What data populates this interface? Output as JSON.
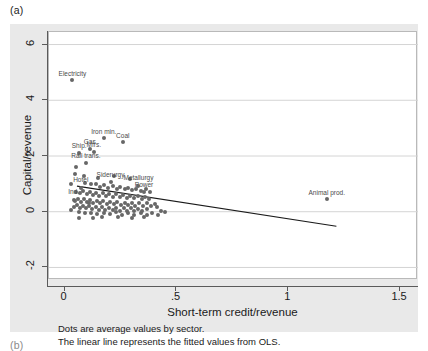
{
  "panel": {
    "letter_a": "(a)",
    "letter_b": "(b)"
  },
  "caption": {
    "line1": "Dots are average values by sector.",
    "line2": "The linear line represents the fitted values from OLS."
  },
  "colors": {
    "figure_background": "#e9e9e9",
    "plot_background": "#ffffff",
    "marker": "#676767",
    "fit_line": "#1a1a1a",
    "grid": "#d4d4d4",
    "axis": "#5a5a5a"
  },
  "chart_data": {
    "type": "scatter",
    "title": "",
    "xlabel": "Short-term credit/revenue",
    "ylabel": "Capital/revenue",
    "xlim": [
      -0.07,
      1.58
    ],
    "ylim": [
      -2.45,
      6.45
    ],
    "xticks": [
      0,
      0.5,
      1,
      1.5
    ],
    "xticklabels": [
      "0",
      ".5",
      "1",
      "1.5"
    ],
    "yticks": [
      -2,
      0,
      2,
      4,
      6
    ],
    "yticklabels": [
      "-2",
      "0",
      "2",
      "4",
      "6"
    ],
    "grid": "horizontal",
    "legend": null,
    "annotations": [
      "Dots are average values by sector.",
      "The linear line represents the fitted values from OLS."
    ],
    "fit_line": {
      "name": "OLS fitted values",
      "x": [
        0.055,
        1.215
      ],
      "y": [
        0.92,
        -0.52
      ]
    },
    "labeled_points": [
      {
        "label": "Electricity",
        "x": 0.035,
        "y": 4.72
      },
      {
        "label": "Iron min.",
        "x": 0.175,
        "y": 2.66
      },
      {
        "label": "Coal",
        "x": 0.26,
        "y": 2.52
      },
      {
        "label": "Gas",
        "x": 0.112,
        "y": 2.3
      },
      {
        "label": "Ship.",
        "x": 0.065,
        "y": 2.15
      },
      {
        "label": "Mfrs.",
        "x": 0.13,
        "y": 2.18
      },
      {
        "label": "Rail trans.",
        "x": 0.095,
        "y": 1.78
      },
      {
        "label": "Siderurgy",
        "x": 0.205,
        "y": 1.12
      },
      {
        "label": "Metallurgy",
        "x": 0.33,
        "y": 1.0
      },
      {
        "label": "Hotel",
        "x": 0.072,
        "y": 0.92
      },
      {
        "label": "Power",
        "x": 0.355,
        "y": 0.76
      },
      {
        "label": "Ind.",
        "x": 0.04,
        "y": 0.48
      },
      {
        "label": "Animal prod.",
        "x": 1.172,
        "y": 0.45
      }
    ],
    "points": [
      {
        "x": 0.035,
        "y": 4.72
      },
      {
        "x": 0.175,
        "y": 2.66
      },
      {
        "x": 0.26,
        "y": 2.52
      },
      {
        "x": 0.112,
        "y": 2.26
      },
      {
        "x": 0.065,
        "y": 2.12
      },
      {
        "x": 0.13,
        "y": 2.14
      },
      {
        "x": 0.095,
        "y": 1.74
      },
      {
        "x": 0.205,
        "y": 1.06
      },
      {
        "x": 0.33,
        "y": 0.94
      },
      {
        "x": 0.072,
        "y": 0.86
      },
      {
        "x": 0.355,
        "y": 0.7
      },
      {
        "x": 0.04,
        "y": 0.42
      },
      {
        "x": 1.172,
        "y": 0.45
      },
      {
        "x": 0.09,
        "y": 1.04
      },
      {
        "x": 0.118,
        "y": 0.98
      },
      {
        "x": 0.142,
        "y": 1.0
      },
      {
        "x": 0.16,
        "y": 0.9
      },
      {
        "x": 0.178,
        "y": 0.95
      },
      {
        "x": 0.196,
        "y": 0.86
      },
      {
        "x": 0.215,
        "y": 0.92
      },
      {
        "x": 0.232,
        "y": 0.83
      },
      {
        "x": 0.248,
        "y": 0.88
      },
      {
        "x": 0.268,
        "y": 0.8
      },
      {
        "x": 0.285,
        "y": 0.86
      },
      {
        "x": 0.302,
        "y": 0.78
      },
      {
        "x": 0.318,
        "y": 0.82
      },
      {
        "x": 0.34,
        "y": 0.74
      },
      {
        "x": 0.362,
        "y": 0.8
      },
      {
        "x": 0.382,
        "y": 0.7
      },
      {
        "x": 0.052,
        "y": 0.72
      },
      {
        "x": 0.068,
        "y": 0.66
      },
      {
        "x": 0.082,
        "y": 0.74
      },
      {
        "x": 0.098,
        "y": 0.62
      },
      {
        "x": 0.112,
        "y": 0.7
      },
      {
        "x": 0.126,
        "y": 0.6
      },
      {
        "x": 0.14,
        "y": 0.68
      },
      {
        "x": 0.155,
        "y": 0.58
      },
      {
        "x": 0.17,
        "y": 0.66
      },
      {
        "x": 0.186,
        "y": 0.56
      },
      {
        "x": 0.2,
        "y": 0.64
      },
      {
        "x": 0.216,
        "y": 0.54
      },
      {
        "x": 0.23,
        "y": 0.62
      },
      {
        "x": 0.246,
        "y": 0.52
      },
      {
        "x": 0.262,
        "y": 0.6
      },
      {
        "x": 0.278,
        "y": 0.5
      },
      {
        "x": 0.294,
        "y": 0.58
      },
      {
        "x": 0.31,
        "y": 0.48
      },
      {
        "x": 0.326,
        "y": 0.56
      },
      {
        "x": 0.344,
        "y": 0.46
      },
      {
        "x": 0.36,
        "y": 0.54
      },
      {
        "x": 0.378,
        "y": 0.44
      },
      {
        "x": 0.045,
        "y": 0.4
      },
      {
        "x": 0.058,
        "y": 0.46
      },
      {
        "x": 0.072,
        "y": 0.36
      },
      {
        "x": 0.086,
        "y": 0.44
      },
      {
        "x": 0.1,
        "y": 0.34
      },
      {
        "x": 0.114,
        "y": 0.42
      },
      {
        "x": 0.128,
        "y": 0.32
      },
      {
        "x": 0.144,
        "y": 0.4
      },
      {
        "x": 0.158,
        "y": 0.3
      },
      {
        "x": 0.172,
        "y": 0.38
      },
      {
        "x": 0.188,
        "y": 0.28
      },
      {
        "x": 0.204,
        "y": 0.36
      },
      {
        "x": 0.22,
        "y": 0.26
      },
      {
        "x": 0.236,
        "y": 0.34
      },
      {
        "x": 0.252,
        "y": 0.24
      },
      {
        "x": 0.268,
        "y": 0.33
      },
      {
        "x": 0.284,
        "y": 0.23
      },
      {
        "x": 0.3,
        "y": 0.32
      },
      {
        "x": 0.316,
        "y": 0.22
      },
      {
        "x": 0.334,
        "y": 0.31
      },
      {
        "x": 0.35,
        "y": 0.21
      },
      {
        "x": 0.368,
        "y": 0.3
      },
      {
        "x": 0.386,
        "y": 0.2
      },
      {
        "x": 0.402,
        "y": 0.28
      },
      {
        "x": 0.04,
        "y": 0.18
      },
      {
        "x": 0.054,
        "y": 0.24
      },
      {
        "x": 0.068,
        "y": 0.14
      },
      {
        "x": 0.082,
        "y": 0.22
      },
      {
        "x": 0.096,
        "y": 0.12
      },
      {
        "x": 0.11,
        "y": 0.2
      },
      {
        "x": 0.124,
        "y": 0.1
      },
      {
        "x": 0.138,
        "y": 0.18
      },
      {
        "x": 0.152,
        "y": 0.08
      },
      {
        "x": 0.168,
        "y": 0.16
      },
      {
        "x": 0.182,
        "y": 0.06
      },
      {
        "x": 0.198,
        "y": 0.15
      },
      {
        "x": 0.214,
        "y": 0.05
      },
      {
        "x": 0.23,
        "y": 0.14
      },
      {
        "x": 0.246,
        "y": 0.04
      },
      {
        "x": 0.264,
        "y": 0.13
      },
      {
        "x": 0.28,
        "y": 0.03
      },
      {
        "x": 0.296,
        "y": 0.12
      },
      {
        "x": 0.312,
        "y": 0.02
      },
      {
        "x": 0.33,
        "y": 0.11
      },
      {
        "x": 0.348,
        "y": 0.01
      },
      {
        "x": 0.366,
        "y": 0.1
      },
      {
        "x": 0.062,
        "y": -0.02
      },
      {
        "x": 0.09,
        "y": -0.06
      },
      {
        "x": 0.118,
        "y": -0.03
      },
      {
        "x": 0.146,
        "y": -0.08
      },
      {
        "x": 0.174,
        "y": -0.04
      },
      {
        "x": 0.202,
        "y": -0.09
      },
      {
        "x": 0.228,
        "y": -0.02
      },
      {
        "x": 0.256,
        "y": -0.1
      },
      {
        "x": 0.284,
        "y": -0.05
      },
      {
        "x": 0.312,
        "y": -0.11
      },
      {
        "x": 0.34,
        "y": -0.04
      },
      {
        "x": 0.368,
        "y": -0.12
      },
      {
        "x": 0.392,
        "y": -0.06
      },
      {
        "x": 0.416,
        "y": -0.1
      },
      {
        "x": 0.086,
        "y": 1.28
      },
      {
        "x": 0.15,
        "y": 1.22
      },
      {
        "x": 0.222,
        "y": 1.3
      },
      {
        "x": 0.29,
        "y": 1.18
      },
      {
        "x": 0.046,
        "y": 1.36
      },
      {
        "x": 0.108,
        "y": 0.3
      },
      {
        "x": 0.166,
        "y": -0.18
      },
      {
        "x": 0.238,
        "y": -0.2
      },
      {
        "x": 0.064,
        "y": -0.22
      },
      {
        "x": 0.125,
        "y": -0.24
      },
      {
        "x": 0.3,
        "y": -0.22
      },
      {
        "x": 0.356,
        "y": -0.18
      },
      {
        "x": 0.412,
        "y": 0.16
      },
      {
        "x": 0.43,
        "y": 0.04
      },
      {
        "x": 0.448,
        "y": -0.02
      },
      {
        "x": 0.03,
        "y": 0.98
      },
      {
        "x": 0.028,
        "y": 0.08
      },
      {
        "x": 0.05,
        "y": 1.6
      }
    ]
  }
}
